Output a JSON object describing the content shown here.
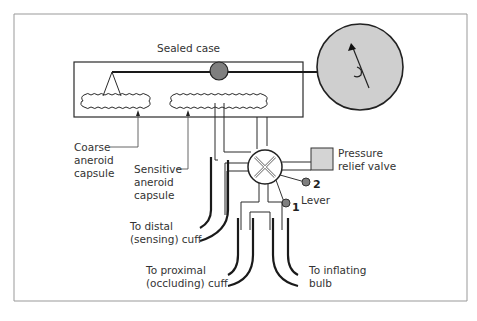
{
  "diagram": {
    "title": "Sealed case",
    "labels": {
      "sealed_case": "Sealed case",
      "coarse_capsule": "Coarse\naneroid\ncapsule",
      "sensitive_capsule": "Sensitive\naneroid\ncapsule",
      "pressure_relief_valve": "Pressure\nrelief valve",
      "lever": "Lever",
      "lever_position_1": "1",
      "lever_position_2": "2",
      "distal_cuff": "To distal\n(sensing) cuff",
      "proximal_cuff": "To proximal\n(occluding) cuff",
      "inflating_bulb": "To inflating\nbulb"
    },
    "colors": {
      "line": "#2a2a2a",
      "dial_fill": "#cfcfcf",
      "pivot_fill": "#808080",
      "valve_box_fill": "#d4d4d4",
      "frame": "#888888"
    }
  }
}
